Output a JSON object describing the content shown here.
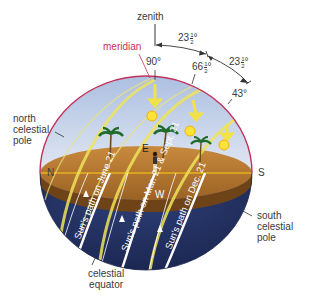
{
  "diagram": {
    "labels": {
      "zenith": "zenith",
      "meridian": "meridian",
      "north_celestial_pole": [
        "north",
        "celestial",
        "pole"
      ],
      "south_celestial_pole": [
        "south",
        "celestial",
        "pole"
      ],
      "celestial_equator": [
        "celestial",
        "equator"
      ],
      "north": "N",
      "south": "S",
      "east": "E",
      "west": "W"
    },
    "angles": {
      "a90": "90°",
      "a66": {
        "whole": "66",
        "num": "1",
        "den": "2",
        "deg": "°"
      },
      "a43": "43°",
      "tilt_upper": {
        "whole": "23",
        "num": "1",
        "den": "2",
        "deg": "°"
      },
      "tilt_lower": {
        "whole": "23",
        "num": "1",
        "den": "2",
        "deg": "°"
      }
    },
    "paths": [
      {
        "label": "Sun's path on June 21",
        "altitude": "90°"
      },
      {
        "label": "Sun's path on Mar. 21 & Sept. 21",
        "altitude": "66½°"
      },
      {
        "label": "Sun's path on Dec. 21",
        "altitude": "43°"
      }
    ],
    "colors": {
      "sky_top": "#a9bde0",
      "sky_bottom": "#dfe6f2",
      "ground": "#b77a34",
      "ground_dark": "#7a4a1a",
      "below_horizon": "#1f2d5c",
      "meridian": "#c2315a",
      "sun_path": "#f2e24a",
      "horizon_line": "#e6b21e"
    }
  }
}
